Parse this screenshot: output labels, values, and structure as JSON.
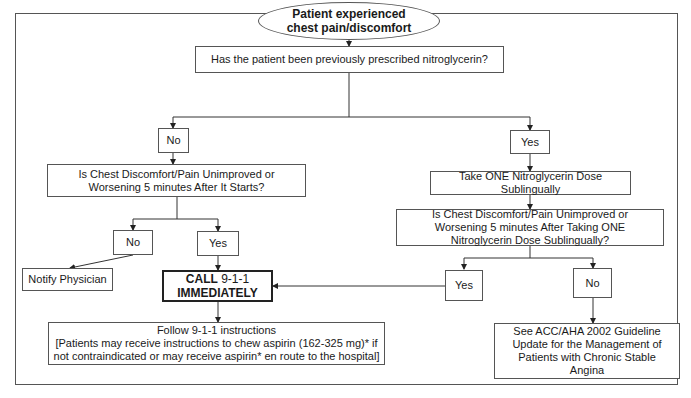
{
  "diagram": {
    "type": "flowchart",
    "nodes": {
      "start": "Patient experienced chest pain/discomfort",
      "q_nitro": "Has the patient been previously prescribed nitroglycerin?",
      "no_nitro": "No",
      "yes_nitro": "Yes",
      "q_5min": "Is Chest Discomfort/Pain Unimproved or Worsening 5 minutes After It Starts?",
      "take_one": "Take ONE Nitroglycerin Dose Sublingually",
      "q_after_dose": "Is Chest Discomfort/Pain Unimproved or Worsening 5 minutes After Taking ONE Nitroglycerin Dose Sublingually?",
      "no_5min": "No",
      "yes_5min": "Yes",
      "notify": "Notify Physician",
      "call_bold": "CALL",
      "call_num": " 9-1-1",
      "call_line2": "IMMEDIATELY",
      "yes_after": "Yes",
      "no_after": "No",
      "follow_line1": "Follow 9-1-1 instructions",
      "follow_line2": "[Patients may receive instructions to chew aspirin (162-325 mg)* if not contraindicated or may receive aspirin* en route to the hospital]",
      "see_acc": "See ACC/AHA  2002 Guideline Update for the Management of Patients with Chronic Stable Angina"
    },
    "edges": [
      [
        "start",
        "q_nitro"
      ],
      [
        "q_nitro",
        "no_nitro"
      ],
      [
        "q_nitro",
        "yes_nitro"
      ],
      [
        "no_nitro",
        "q_5min"
      ],
      [
        "yes_nitro",
        "take_one"
      ],
      [
        "take_one",
        "q_after_dose"
      ],
      [
        "q_5min",
        "no_5min"
      ],
      [
        "q_5min",
        "yes_5min"
      ],
      [
        "no_5min",
        "notify"
      ],
      [
        "yes_5min",
        "call"
      ],
      [
        "q_after_dose",
        "yes_after"
      ],
      [
        "q_after_dose",
        "no_after"
      ],
      [
        "yes_after",
        "call"
      ],
      [
        "no_after",
        "see_acc"
      ],
      [
        "call",
        "follow"
      ]
    ]
  }
}
